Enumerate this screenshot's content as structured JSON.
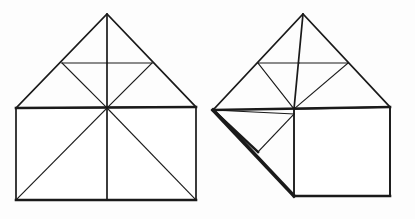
{
  "image": {
    "title": "Hand-drawn geometric dissection of a house shape",
    "background_color": "#fdfdfd",
    "ink_color": "#1a1a1a",
    "width": 415,
    "height": 219,
    "figure_count": 2
  },
  "figures": [
    {
      "id": "left-figure",
      "name": "house-dissection-original",
      "label": "",
      "description": "Square with isosceles triangular roof, subdivided by diagonals",
      "parts": [
        {
          "name": "square-outline",
          "type": "polygon",
          "points": "16,108 196,107 196,200 16,200",
          "weight": "med"
        },
        {
          "name": "roof-outline",
          "type": "polyline",
          "points": "16,108 107,14 196,107",
          "weight": "med"
        },
        {
          "name": "eave-line",
          "type": "line",
          "points": "16,108 196,107",
          "weight": "thick"
        },
        {
          "name": "base-line",
          "type": "line",
          "points": "16,200 196,200",
          "weight": "thick"
        },
        {
          "name": "center-vertical",
          "type": "line",
          "points": "107,14 107,200",
          "weight": "med"
        },
        {
          "name": "roof-left-inner-fold",
          "type": "polyline",
          "points": "62,63 107,108",
          "weight": "thin"
        },
        {
          "name": "roof-left-horizontal-fold",
          "type": "line",
          "points": "62,63 107,63",
          "weight": "thin"
        },
        {
          "name": "roof-right-inner-fold",
          "type": "polyline",
          "points": "152,63 107,108",
          "weight": "thin"
        },
        {
          "name": "roof-right-horizontal-fold",
          "type": "line",
          "points": "107,63 152,63",
          "weight": "thin"
        },
        {
          "name": "square-diagonal-left",
          "type": "line",
          "points": "107,108 16,200",
          "weight": "thin"
        },
        {
          "name": "square-diagonal-right",
          "type": "line",
          "points": "107,108 196,200",
          "weight": "thin"
        }
      ]
    },
    {
      "id": "right-figure",
      "name": "house-dissection-rearranged",
      "label": "",
      "description": "Same house with lower-left triangle rotated outward forming a pinwheel",
      "parts": [
        {
          "name": "roof-outline",
          "type": "polyline",
          "points": "213,110 303,14 390,107",
          "weight": "med"
        },
        {
          "name": "eave-line",
          "type": "line",
          "points": "213,110 390,107",
          "weight": "thick"
        },
        {
          "name": "center-vertical-roof",
          "type": "line",
          "points": "303,14 294,109",
          "weight": "med"
        },
        {
          "name": "roof-left-inner-fold",
          "type": "polyline",
          "points": "258,63 294,109",
          "weight": "thin"
        },
        {
          "name": "roof-left-horizontal-fold",
          "type": "line",
          "points": "258,63 299,63",
          "weight": "thin"
        },
        {
          "name": "roof-right-inner-fold",
          "type": "polyline",
          "points": "348,63 294,109",
          "weight": "thin"
        },
        {
          "name": "roof-right-horizontal-fold",
          "type": "line",
          "points": "299,63 348,63",
          "weight": "thin"
        },
        {
          "name": "square-outline",
          "type": "polygon",
          "points": "294,109 390,107 390,196 294,196",
          "weight": "med"
        },
        {
          "name": "square-right-edge",
          "type": "line",
          "points": "390,107 390,196",
          "weight": "med"
        },
        {
          "name": "square-base-line",
          "type": "line",
          "points": "294,196 390,196",
          "weight": "thick"
        },
        {
          "name": "square-diagonal-right",
          "type": "line",
          "points": "294,109 390,196",
          "weight": "thin"
        },
        {
          "name": "pinwheel-vertical-thick",
          "type": "line",
          "points": "294,109 294,196",
          "weight": "xthick"
        },
        {
          "name": "rotated-triangle-hypotenuse",
          "type": "line",
          "points": "213,110 294,196",
          "weight": "thin"
        },
        {
          "name": "rotated-triangle-upper-edge",
          "type": "line",
          "points": "213,110 294,114",
          "weight": "thick"
        },
        {
          "name": "inner-fold-a",
          "type": "line",
          "points": "213,110 258,152",
          "weight": "thin"
        },
        {
          "name": "inner-fold-b",
          "type": "line",
          "points": "258,152 294,114",
          "weight": "thin"
        }
      ]
    }
  ]
}
